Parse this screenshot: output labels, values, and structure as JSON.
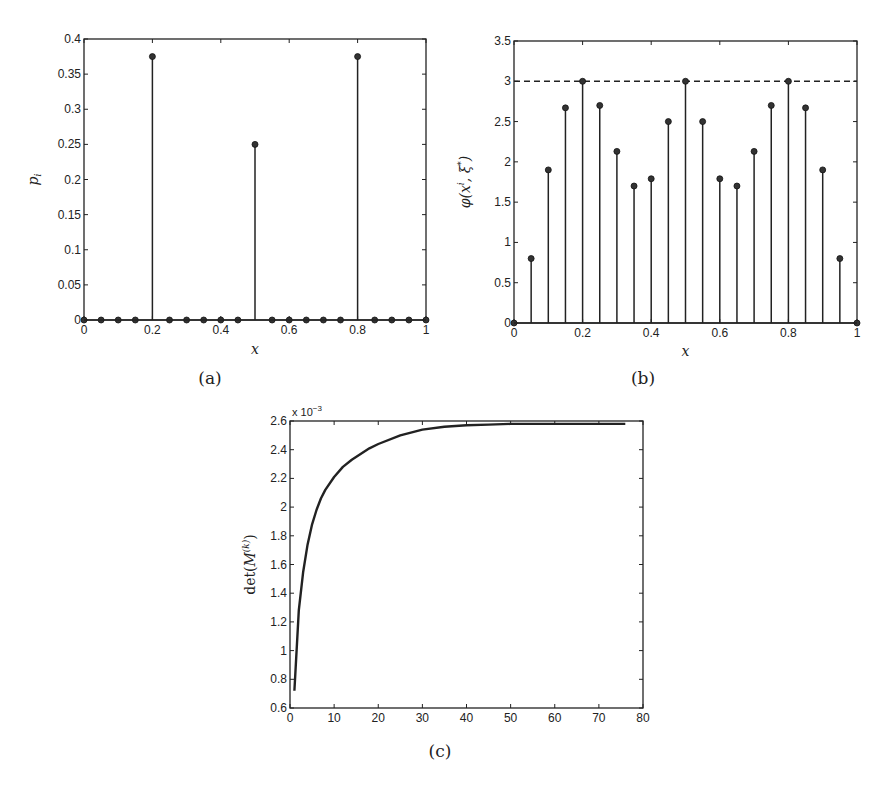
{
  "chart_data": [
    {
      "id": "a",
      "type": "stem",
      "caption": "(a)",
      "xlabel": "x",
      "ylabel": "p_i",
      "xlim": [
        0,
        1
      ],
      "ylim": [
        0,
        0.4
      ],
      "xticks": [
        "0",
        "0.2",
        "0.4",
        "0.6",
        "0.8",
        "1"
      ],
      "yticks": [
        "0",
        "0.05",
        "0.1",
        "0.15",
        "0.2",
        "0.25",
        "0.3",
        "0.35",
        "0.4"
      ],
      "grid": false,
      "x": [
        0,
        0.05,
        0.1,
        0.15,
        0.2,
        0.25,
        0.3,
        0.35,
        0.4,
        0.45,
        0.5,
        0.55,
        0.6,
        0.65,
        0.7,
        0.75,
        0.8,
        0.85,
        0.9,
        0.95,
        1
      ],
      "values": [
        0,
        0,
        0,
        0,
        0.375,
        0,
        0,
        0,
        0,
        0,
        0.25,
        0,
        0,
        0,
        0,
        0,
        0.375,
        0,
        0,
        0,
        0
      ]
    },
    {
      "id": "b",
      "type": "stem",
      "caption": "(b)",
      "xlabel": "x",
      "ylabel": "φ(x^i, ξ*)",
      "xlim": [
        0,
        1
      ],
      "ylim": [
        0,
        3.5
      ],
      "xticks": [
        "0",
        "0.2",
        "0.4",
        "0.6",
        "0.8",
        "1"
      ],
      "yticks": [
        "0",
        "0.5",
        "1",
        "1.5",
        "2",
        "2.5",
        "3",
        "3.5"
      ],
      "grid": false,
      "reference_line": {
        "y": 3,
        "style": "dashed"
      },
      "x": [
        0,
        0.05,
        0.1,
        0.15,
        0.2,
        0.25,
        0.3,
        0.35,
        0.4,
        0.45,
        0.5,
        0.55,
        0.6,
        0.65,
        0.7,
        0.75,
        0.8,
        0.85,
        0.9,
        0.95,
        1
      ],
      "values": [
        0,
        0.8,
        1.9,
        2.67,
        3.0,
        2.7,
        2.13,
        1.7,
        1.79,
        2.5,
        3.0,
        2.5,
        1.79,
        1.7,
        2.13,
        2.7,
        3.0,
        2.67,
        1.9,
        0.8,
        0
      ]
    },
    {
      "id": "c",
      "type": "line",
      "caption": "(c)",
      "xlabel": "",
      "ylabel": "det(M^(k))",
      "y_multiplier": "x 10^-3",
      "xlim": [
        0,
        80
      ],
      "ylim": [
        0.6,
        2.6
      ],
      "xticks": [
        "0",
        "10",
        "20",
        "30",
        "40",
        "50",
        "60",
        "70",
        "80"
      ],
      "yticks": [
        "0.6",
        "0.8",
        "1",
        "1.2",
        "1.4",
        "1.6",
        "1.8",
        "2",
        "2.2",
        "2.4",
        "2.6"
      ],
      "grid": false,
      "x": [
        1,
        2,
        3,
        4,
        5,
        6,
        7,
        8,
        10,
        12,
        14,
        16,
        18,
        20,
        25,
        30,
        35,
        40,
        45,
        50,
        60,
        70,
        76
      ],
      "values": [
        0.72,
        1.28,
        1.55,
        1.74,
        1.88,
        1.98,
        2.06,
        2.12,
        2.21,
        2.28,
        2.33,
        2.37,
        2.41,
        2.44,
        2.5,
        2.54,
        2.56,
        2.57,
        2.575,
        2.58,
        2.58,
        2.58,
        2.58
      ]
    }
  ]
}
